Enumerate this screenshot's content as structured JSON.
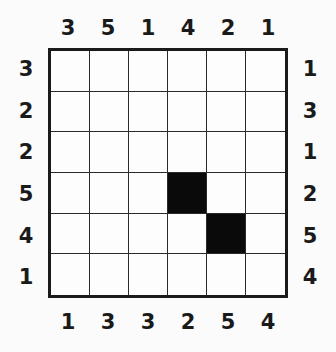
{
  "puzzle": {
    "type": "skyscraper",
    "size": 6,
    "clues": {
      "top": [
        "3",
        "5",
        "1",
        "4",
        "2",
        "1"
      ],
      "bottom": [
        "1",
        "3",
        "3",
        "2",
        "5",
        "4"
      ],
      "left": [
        "3",
        "2",
        "2",
        "5",
        "4",
        "1"
      ],
      "right": [
        "1",
        "3",
        "1",
        "2",
        "5",
        "4"
      ]
    },
    "filled_cells": [
      {
        "row": 3,
        "col": 3
      },
      {
        "row": 4,
        "col": 4
      }
    ],
    "colors": {
      "line": "#1a1a1a",
      "filled": "#0a0a0a",
      "empty": "#fdfdfd"
    }
  }
}
